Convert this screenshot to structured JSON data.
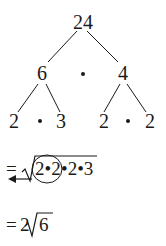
{
  "tree": {
    "root": {
      "label": "24"
    },
    "level1": {
      "left": {
        "label": "6"
      },
      "operator": "•",
      "right": {
        "label": "4"
      }
    },
    "level2": {
      "left_group": {
        "a": "2",
        "op": "•",
        "b": "3"
      },
      "right_group": {
        "a": "2",
        "op": "•",
        "b": "2"
      }
    }
  },
  "steps": [
    {
      "prefix": "=",
      "radicand_circled": "2•2",
      "radicand_rest": "•2•3",
      "annotation": "circle around pair 2•2 with arrow pointing left"
    },
    {
      "prefix": "=",
      "coefficient": "2",
      "radicand": "6"
    }
  ],
  "colors": {
    "ink": "#1a1a1a",
    "background": "#ffffff"
  }
}
